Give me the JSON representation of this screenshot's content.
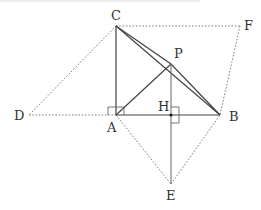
{
  "diagram": {
    "type": "geometry",
    "points": {
      "C": {
        "label": "C",
        "x": 116,
        "y": 26
      },
      "F": {
        "label": "F",
        "x": 240,
        "y": 26
      },
      "D": {
        "label": "D",
        "x": 29,
        "y": 115
      },
      "A": {
        "label": "A",
        "x": 116,
        "y": 115
      },
      "B": {
        "label": "B",
        "x": 220,
        "y": 115
      },
      "H": {
        "label": "H",
        "x": 171,
        "y": 115
      },
      "P": {
        "label": "P",
        "x": 171,
        "y": 64
      },
      "E": {
        "label": "E",
        "x": 171,
        "y": 184
      }
    },
    "labels": {
      "C": "C",
      "F": "F",
      "D": "D",
      "A": "A",
      "B": "B",
      "H": "H",
      "P": "P",
      "E": "E"
    },
    "solid_segments": [
      "CA",
      "AB",
      "CB",
      "CP",
      "PB",
      "AP",
      "PE"
    ],
    "dotted_segments": [
      "CF",
      "FB",
      "CD",
      "DA",
      "AE",
      "EB"
    ],
    "right_angles": [
      "CAB",
      "PHB"
    ],
    "colors": {
      "line": "#444444",
      "dotted": "#777777",
      "label": "#333333"
    }
  }
}
